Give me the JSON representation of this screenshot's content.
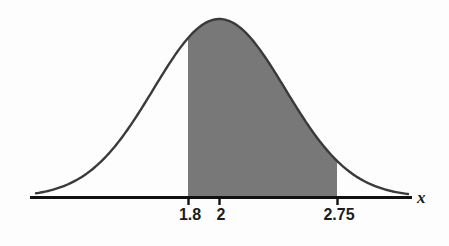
{
  "chart_data": {
    "type": "area",
    "title": "",
    "subtitle": "",
    "xlabel": "x",
    "ylabel": "",
    "curve": "normal",
    "mean": 2,
    "sigma": 0.42,
    "shaded_region": {
      "from": 1.8,
      "to": 2.75,
      "fill_color": "#787878"
    },
    "axis": {
      "show_x_axis": true,
      "show_y_axis": false,
      "grid": false,
      "line_color": "#111111"
    },
    "ticks": [
      {
        "value": 1.8,
        "label": "1.8",
        "px": 188
      },
      {
        "value": 2,
        "label": "2",
        "px": 219
      },
      {
        "value": 2.75,
        "label": "2.75",
        "px": 337
      }
    ],
    "legend": null,
    "annotations": []
  },
  "figure": {
    "axis_label": "x",
    "tick_labels": {
      "lower": "1.8",
      "mean": "2",
      "upper": "2.75"
    },
    "colors": {
      "shade": "#787878",
      "curve": "#3a3a3a",
      "axis": "#111111",
      "text": "#1c1c1c",
      "background": "#fdfdfd"
    }
  }
}
